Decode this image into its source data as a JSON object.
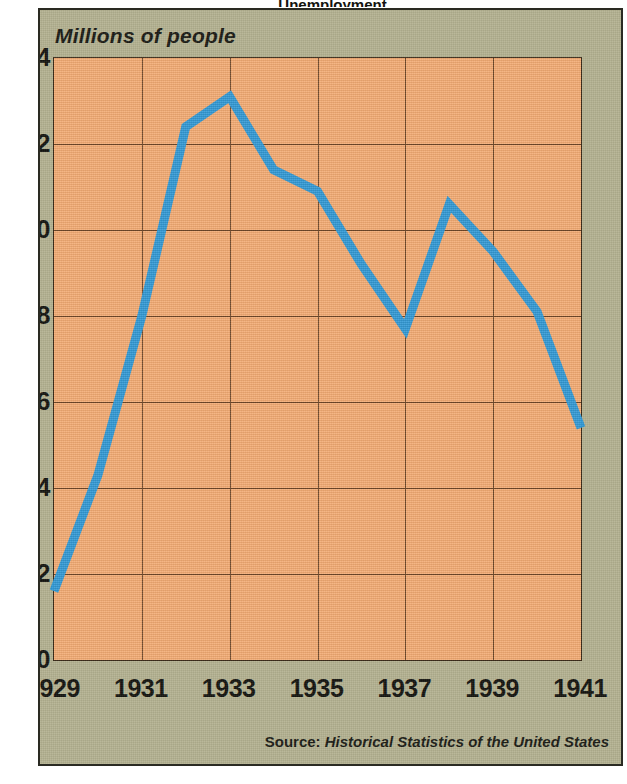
{
  "figure": {
    "cropped_title_sliver": "Unemployment",
    "background_color": "#b4b291",
    "plot_background_color": "#f4ac74",
    "line_color": "#2f99d6",
    "grid_color": "#6b4526",
    "text_color": "#14140f"
  },
  "axis_title": "Millions of people",
  "source": {
    "label": "Source:",
    "title": "Historical Statistics of the United States"
  },
  "chart_data": {
    "type": "line",
    "title": "",
    "subtitle": "",
    "xlabel": "",
    "ylabel": "Millions of people",
    "xlim": [
      1929,
      1941
    ],
    "ylim": [
      0,
      14
    ],
    "xticks": [
      "1929",
      "1931",
      "1933",
      "1935",
      "1937",
      "1939",
      "1941"
    ],
    "xtick_values": [
      1929,
      1931,
      1933,
      1935,
      1937,
      1939,
      1941
    ],
    "yticks": [
      "0",
      "2",
      "4",
      "6",
      "8",
      "10",
      "12",
      "14"
    ],
    "ytick_values": [
      0,
      2,
      4,
      6,
      8,
      10,
      12,
      14
    ],
    "grid": true,
    "legend": false,
    "legend_position": "none",
    "x": [
      1929,
      1930,
      1931,
      1932,
      1933,
      1934,
      1935,
      1936,
      1937,
      1938,
      1939,
      1940,
      1941
    ],
    "series": [
      {
        "name": "Unemployment",
        "color": "#2f99d6",
        "values": [
          1.6,
          4.3,
          8.0,
          12.4,
          13.1,
          11.4,
          10.9,
          9.2,
          7.7,
          10.6,
          9.5,
          8.1,
          5.4
        ]
      }
    ]
  }
}
